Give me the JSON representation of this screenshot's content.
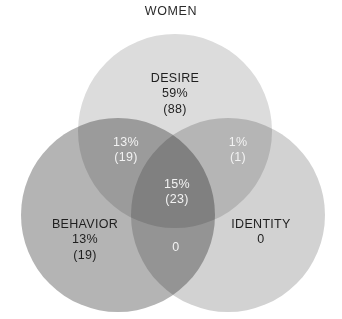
{
  "figure": {
    "title": "WOMEN",
    "type": "venn3",
    "background": "#ffffff"
  },
  "chart_data": {
    "type": "venn",
    "title": "WOMEN",
    "subtitle": "",
    "xlabel": "",
    "ylabel": "",
    "grid": false,
    "legend": "none",
    "set_names": [
      "DESIRE",
      "BEHAVIOR",
      "IDENTITY"
    ],
    "total": 150,
    "regions": [
      {
        "id": "desire-only",
        "sets": [
          "DESIRE"
        ],
        "label": "DESIRE",
        "percent": "59%",
        "count": "(88)",
        "value": 88,
        "percent_value": 59,
        "fill": "#dcdcdc",
        "text_color": "#1f1f1f"
      },
      {
        "id": "behavior-only",
        "sets": [
          "BEHAVIOR"
        ],
        "label": "BEHAVIOR",
        "percent": "13%",
        "count": "(19)",
        "value": 19,
        "percent_value": 13,
        "fill": "#9a9a9a",
        "text_color": "#1f1f1f"
      },
      {
        "id": "identity-only",
        "sets": [
          "IDENTITY"
        ],
        "label": "IDENTITY",
        "percent": "0",
        "count": "",
        "value": 0,
        "percent_value": 0,
        "fill": "#c8c8c8",
        "text_color": "#1f1f1f"
      },
      {
        "id": "desire-behavior",
        "sets": [
          "DESIRE",
          "BEHAVIOR"
        ],
        "label": "",
        "percent": "13%",
        "count": "(19)",
        "value": 19,
        "percent_value": 13,
        "fill": "#767676",
        "text_color": "#f2f2f2"
      },
      {
        "id": "desire-identity",
        "sets": [
          "DESIRE",
          "IDENTITY"
        ],
        "label": "",
        "percent": "1%",
        "count": "(1)",
        "value": 1,
        "percent_value": 1,
        "fill": "#8e8e8e",
        "text_color": "#f2f2f2"
      },
      {
        "id": "behavior-identity",
        "sets": [
          "BEHAVIOR",
          "IDENTITY"
        ],
        "label": "",
        "percent": "0",
        "count": "",
        "value": 0,
        "percent_value": 0,
        "fill": "#6e6e6e",
        "text_color": "#f2f2f2"
      },
      {
        "id": "all-three",
        "sets": [
          "DESIRE",
          "BEHAVIOR",
          "IDENTITY"
        ],
        "label": "",
        "percent": "15%",
        "count": "(23)",
        "value": 23,
        "percent_value": 15,
        "fill": "#4a4a4a",
        "text_color": "#f2f2f2"
      }
    ],
    "circles": [
      {
        "name": "DESIRE",
        "cx": 175,
        "cy": 131,
        "r": 97,
        "fill": "#dcdcdc"
      },
      {
        "name": "BEHAVIOR",
        "cx": 118,
        "cy": 215,
        "r": 97,
        "fill": "#b4b4b4"
      },
      {
        "name": "IDENTITY",
        "cx": 228,
        "cy": 215,
        "r": 97,
        "fill": "#d2d2d2"
      }
    ]
  }
}
